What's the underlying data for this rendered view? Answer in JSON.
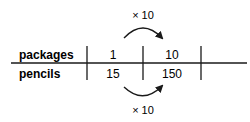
{
  "diagram": {
    "type": "double-number-line",
    "rows": [
      {
        "label": "packages",
        "values": [
          "1",
          "10"
        ]
      },
      {
        "label": "pencils",
        "values": [
          "15",
          "150"
        ]
      }
    ],
    "top_arrow": {
      "label": "× 10",
      "from": "1",
      "to": "10"
    },
    "bottom_arrow": {
      "label": "× 10",
      "from": "15",
      "to": "150"
    },
    "colors": {
      "line": "#1a1a1a",
      "text": "#1a1a1a",
      "background": "#ffffff"
    }
  }
}
